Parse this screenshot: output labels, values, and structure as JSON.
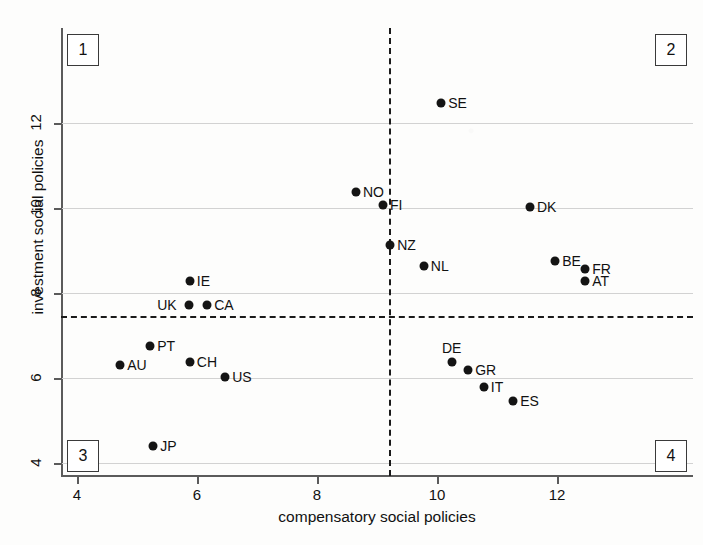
{
  "chart_data": {
    "type": "scatter",
    "title": "",
    "xlabel": "compensatory social policies",
    "ylabel": "investment social policies",
    "xlim": [
      3.7,
      14.2
    ],
    "ylim": [
      3.55,
      13.4
    ],
    "xticks": [
      4,
      6,
      8,
      10,
      12
    ],
    "yticks": [
      4,
      6,
      8,
      10,
      12
    ],
    "grid": "horizontal",
    "legend": "none",
    "reference_lines": {
      "vertical_x": 9.2,
      "horizontal_y": 7.45,
      "style": "dashed"
    },
    "quadrant_labels": [
      {
        "id": "1",
        "position": "top-left"
      },
      {
        "id": "2",
        "position": "top-right"
      },
      {
        "id": "3",
        "position": "bottom-left"
      },
      {
        "id": "4",
        "position": "bottom-right"
      }
    ],
    "points": [
      {
        "label": "SE",
        "x": 10.07,
        "y": 12.47,
        "label_pos": "right"
      },
      {
        "label": "NO",
        "x": 8.65,
        "y": 10.38,
        "label_pos": "right"
      },
      {
        "label": "FI",
        "x": 9.1,
        "y": 10.07,
        "label_pos": "right"
      },
      {
        "label": "DK",
        "x": 11.55,
        "y": 10.02,
        "label_pos": "right"
      },
      {
        "label": "NZ",
        "x": 9.22,
        "y": 9.13,
        "label_pos": "right"
      },
      {
        "label": "NL",
        "x": 9.78,
        "y": 8.64,
        "label_pos": "right"
      },
      {
        "label": "BE",
        "x": 11.97,
        "y": 8.75,
        "label_pos": "right"
      },
      {
        "label": "FR",
        "x": 12.47,
        "y": 8.56,
        "label_pos": "right"
      },
      {
        "label": "AT",
        "x": 12.47,
        "y": 8.28,
        "label_pos": "right"
      },
      {
        "label": "IE",
        "x": 5.88,
        "y": 8.28,
        "label_pos": "right"
      },
      {
        "label": "UK",
        "x": 5.87,
        "y": 7.72,
        "label_pos": "left"
      },
      {
        "label": "CA",
        "x": 6.17,
        "y": 7.72,
        "label_pos": "right"
      },
      {
        "label": "PT",
        "x": 5.22,
        "y": 6.76,
        "label_pos": "right"
      },
      {
        "label": "AU",
        "x": 4.72,
        "y": 6.3,
        "label_pos": "right"
      },
      {
        "label": "CH",
        "x": 5.88,
        "y": 6.37,
        "label_pos": "right"
      },
      {
        "label": "US",
        "x": 6.47,
        "y": 6.02,
        "label_pos": "right"
      },
      {
        "label": "DE",
        "x": 10.25,
        "y": 6.37,
        "label_pos": "above"
      },
      {
        "label": "GR",
        "x": 10.52,
        "y": 6.18,
        "label_pos": "right"
      },
      {
        "label": "IT",
        "x": 10.78,
        "y": 5.8,
        "label_pos": "right"
      },
      {
        "label": "ES",
        "x": 11.27,
        "y": 5.47,
        "label_pos": "right"
      },
      {
        "label": "JP",
        "x": 5.27,
        "y": 4.4,
        "label_pos": "right"
      }
    ],
    "colors": {
      "point": "#141414",
      "axis": "#5b5b5b",
      "grid": "#d2d2d2",
      "reference_line": "#1a1a1a",
      "background": "#fdfdfc"
    }
  }
}
